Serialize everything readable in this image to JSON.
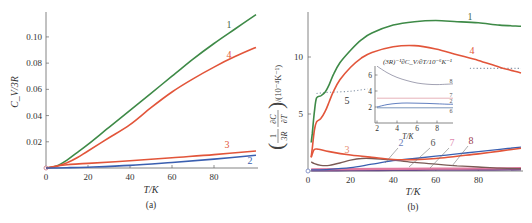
{
  "chart_data": [
    {
      "id": "a",
      "type": "line",
      "caption": "(a)",
      "xlabel": "T/K",
      "ylabel": "C_V/3R",
      "xlim": [
        0,
        100
      ],
      "ylim": [
        0,
        0.119
      ],
      "xticks": [
        0,
        20,
        40,
        60,
        80
      ],
      "yticks": [
        0.02,
        0.04,
        0.06,
        0.08,
        0.1
      ],
      "ytick_labels": [
        "0.02",
        "0.04",
        "0.06",
        "0.08",
        "0.10"
      ],
      "series": [
        {
          "name": "1",
          "color": "#3e8a47",
          "x": [
            0,
            5,
            10,
            15,
            20,
            30,
            40,
            50,
            60,
            70,
            80,
            90,
            100
          ],
          "y": [
            0,
            0.0015,
            0.006,
            0.012,
            0.018,
            0.031,
            0.044,
            0.057,
            0.07,
            0.083,
            0.095,
            0.106,
            0.117
          ]
        },
        {
          "name": "4",
          "color": "#e2553a",
          "x": [
            0,
            5,
            10,
            15,
            20,
            30,
            40,
            50,
            60,
            70,
            80,
            90,
            100
          ],
          "y": [
            0,
            0.0012,
            0.004,
            0.008,
            0.013,
            0.023,
            0.033,
            0.046,
            0.058,
            0.068,
            0.077,
            0.085,
            0.092
          ]
        },
        {
          "name": "3",
          "color": "#e2553a",
          "x": [
            0,
            5,
            10,
            20,
            40,
            60,
            80,
            100
          ],
          "y": [
            0,
            0.0015,
            0.0025,
            0.0035,
            0.0055,
            0.0078,
            0.0102,
            0.013
          ]
        },
        {
          "name": "2",
          "color": "#3a5fb0",
          "x": [
            0,
            10,
            20,
            40,
            60,
            80,
            100
          ],
          "y": [
            0,
            0.0002,
            0.0006,
            0.002,
            0.0042,
            0.0068,
            0.0098
          ]
        }
      ]
    },
    {
      "id": "b",
      "type": "line",
      "caption": "(b)",
      "xlabel": "T/K",
      "ylabel": "(1/3R ∂C_V/∂T)/(10⁻⁴K⁻¹)",
      "ylabel_parts": {
        "open": "(",
        "num1": "1",
        "den1": "3R",
        "num2": "∂C",
        "num2_sub": "V",
        "den2": "∂T",
        "close": ")",
        "units": "/(10⁻⁴K⁻¹)"
      },
      "xlim": [
        0,
        100
      ],
      "ylim": [
        0,
        14
      ],
      "xticks": [
        0,
        20,
        40,
        60,
        80
      ],
      "yticks": [
        5,
        10
      ],
      "ytick_labels": [
        "5",
        "10"
      ],
      "series": [
        {
          "name": "1",
          "color": "#3e8a47",
          "x": [
            1.5,
            2,
            3,
            4,
            6,
            8,
            10,
            12,
            15,
            20,
            25,
            30,
            40,
            50,
            60,
            70,
            80,
            90,
            100
          ],
          "y": [
            2.5,
            3.3,
            5.2,
            6.4,
            6.6,
            6.9,
            7.6,
            8.5,
            9.5,
            10.6,
            11.5,
            12.1,
            12.8,
            13.1,
            13.2,
            13.1,
            13.0,
            12.8,
            12.7
          ]
        },
        {
          "name": "4",
          "color": "#e2553a",
          "x": [
            1.5,
            2,
            3,
            4,
            6,
            8,
            10,
            12,
            15,
            20,
            25,
            30,
            40,
            50,
            60,
            70,
            80,
            90,
            100
          ],
          "y": [
            1.2,
            2.0,
            3.6,
            4.3,
            4.6,
            5.2,
            6.1,
            7.0,
            8.0,
            9.1,
            9.9,
            10.4,
            10.9,
            11.0,
            10.7,
            10.2,
            9.7,
            9.1,
            8.6
          ]
        },
        {
          "name": "3",
          "color": "#e2553a",
          "x": [
            1.5,
            2,
            3,
            5,
            10,
            20,
            30,
            40,
            50,
            60,
            70,
            80,
            90,
            100
          ],
          "y": [
            1.2,
            1.5,
            1.9,
            1.9,
            1.7,
            1.4,
            1.2,
            1.0,
            1.0,
            1.1,
            1.3,
            1.5,
            1.75,
            2.0
          ]
        },
        {
          "name": "2",
          "color": "#3a5fb0",
          "x": [
            1.5,
            10,
            20,
            30,
            40,
            50,
            60,
            70,
            80,
            90,
            100
          ],
          "y": [
            0.1,
            0.15,
            0.3,
            0.6,
            0.9,
            1.1,
            1.3,
            1.5,
            1.7,
            1.9,
            2.1
          ]
        },
        {
          "name": "6",
          "color": "#7a5a55",
          "x": [
            1.5,
            3,
            6,
            10,
            15,
            20,
            25,
            30,
            40,
            50,
            60,
            70,
            80,
            90,
            100
          ],
          "y": [
            0.8,
            0.65,
            0.5,
            0.5,
            0.7,
            0.95,
            1.1,
            1.1,
            0.95,
            0.75,
            0.6,
            0.45,
            0.35,
            0.25,
            0.2
          ]
        },
        {
          "name": "7",
          "color": "#e07aa0",
          "x": [
            1.5,
            20,
            40,
            60,
            80,
            100
          ],
          "y": [
            0.15,
            0.17,
            0.18,
            0.2,
            0.22,
            0.25
          ]
        },
        {
          "name": "8",
          "color": "#6a4a8a",
          "x": [
            1.5,
            20,
            40,
            60,
            80,
            100
          ],
          "y": [
            0.05,
            0.07,
            0.09,
            0.11,
            0.12,
            0.13
          ]
        },
        {
          "name": "5",
          "color": "#8896a8",
          "style": "dotted",
          "x": [
            4,
            10,
            20,
            28
          ],
          "y": [
            6.8,
            6.9,
            7.0,
            7.2
          ]
        },
        {
          "name": "5-continued",
          "color": "#8896a8",
          "style": "dotted",
          "x": [
            76,
            85,
            95,
            100
          ],
          "y": [
            9.0,
            9.0,
            9.0,
            9.0
          ]
        }
      ],
      "curve_label_positions_T": {
        "1": 72,
        "4": 73,
        "3": 20,
        "5": 18
      },
      "pointer_labels": [
        "2",
        "6",
        "7",
        "8"
      ],
      "inset": {
        "title": "(3R)⁻¹∂C_V/∂T/10⁻⁶K⁻¹",
        "xlabel": "T/K",
        "xlim": [
          1.8,
          9.6
        ],
        "ylim": [
          0,
          7.5
        ],
        "xticks": [
          2,
          4,
          6,
          8
        ],
        "yticks": [
          2,
          4,
          6
        ],
        "series": [
          {
            "name": "8",
            "color": "#8a8aa0",
            "x": [
              2,
              3,
              4,
              5,
              6,
              7,
              8,
              9,
              9.6
            ],
            "y": [
              7.1,
              6.3,
              5.7,
              5.3,
              5.0,
              4.85,
              4.8,
              4.85,
              4.9
            ]
          },
          {
            "name": "7",
            "color": "#e0a0a8",
            "x": [
              2,
              9.6
            ],
            "y": [
              3.1,
              3.1
            ]
          },
          {
            "name": "2",
            "color": "#3a5fb0",
            "x": [
              2,
              3,
              4,
              5,
              6,
              7,
              8,
              9,
              9.6
            ],
            "y": [
              2.0,
              2.3,
              2.45,
              2.5,
              2.48,
              2.45,
              2.4,
              2.35,
              2.35
            ]
          },
          {
            "name": "6",
            "color": "#5a7aa8",
            "x": [
              2,
              9.6
            ],
            "y": [
              1.9,
              1.9
            ]
          }
        ]
      }
    }
  ]
}
